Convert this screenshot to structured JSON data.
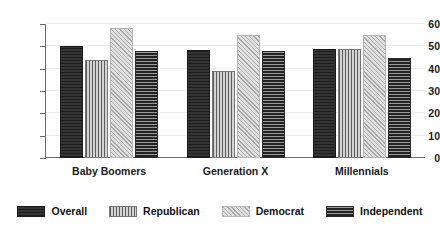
{
  "chart_data": {
    "type": "bar",
    "title": "",
    "subtitle": "",
    "xlabel": "",
    "ylabel": "",
    "ylim": [
      0,
      60
    ],
    "yticks": [
      0,
      10,
      20,
      30,
      40,
      50,
      60
    ],
    "ytick_labels": [
      "0",
      "10",
      "20",
      "30",
      "40",
      "50",
      "60"
    ],
    "grid": true,
    "grid_axis": "y",
    "legend_position": "bottom",
    "categories": [
      "Baby Boomers",
      "Generation X",
      "Millennials"
    ],
    "series": [
      {
        "name": "Overall",
        "values": [
          50,
          48.5,
          49
        ],
        "color": "#2e2e2e",
        "pattern": "solid-dark"
      },
      {
        "name": "Republican",
        "values": [
          44,
          39,
          49
        ],
        "color": "#8e8e8e",
        "pattern": "vertical-stripes"
      },
      {
        "name": "Democrat",
        "values": [
          58,
          55,
          55
        ],
        "color": "#cfcfcf",
        "pattern": "crosshatch-light"
      },
      {
        "name": "Independent",
        "values": [
          48,
          48,
          45
        ],
        "color": "#3a3a3a",
        "pattern": "horizontal-stripes"
      }
    ]
  },
  "axis": {
    "y_tick_labels": [
      "60",
      "50",
      "40",
      "30",
      "20",
      "10",
      "0"
    ]
  },
  "legend": {
    "items": [
      {
        "label": "Overall"
      },
      {
        "label": "Republican"
      },
      {
        "label": "Democrat"
      },
      {
        "label": "Independent"
      }
    ]
  }
}
